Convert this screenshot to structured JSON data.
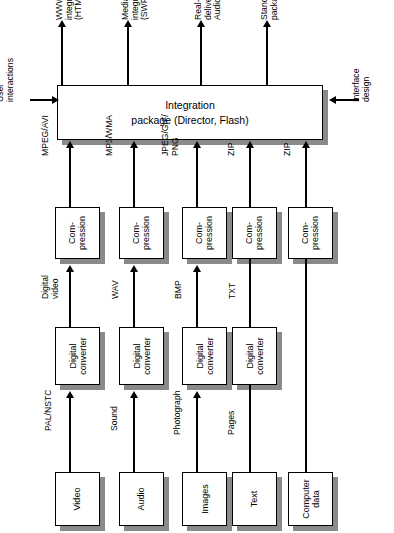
{
  "diagram": {
    "orientation": "rotated-90-ccw",
    "hub": {
      "label": "Integration\npackage (Director, Flash)",
      "left_input": "User\ninteractions",
      "right_input": "Interface\ndesign"
    },
    "outputs": [
      {
        "id": "www",
        "label": "WWW\nintegration\n(HTML/GIF)"
      },
      {
        "id": "mediaplayer",
        "label": "Media player\nintegration\n(SWF/DCR)"
      },
      {
        "id": "realtime",
        "label": "Real-time\ndelivery (Real\nAudio)"
      },
      {
        "id": "standalone",
        "label": "Stand-alone\npackage (EXE)"
      }
    ],
    "columns": [
      {
        "id": "video",
        "source": "Video",
        "source_to_converter": "PAL/NSTC",
        "converter": "Digital\nconverter",
        "converter_to_compression": "Digital\nvideo",
        "compression": "Com-\npression",
        "compression_to_hub": "MPEG/AVI"
      },
      {
        "id": "audio",
        "source": "Audio",
        "source_to_converter": "Sound",
        "converter": "Digital\nconverter",
        "converter_to_compression": "WAV",
        "compression": "Com-\npression",
        "compression_to_hub": "MP3/WMA"
      },
      {
        "id": "images",
        "source": "Images",
        "source_to_converter": "Photograph",
        "converter": "Digital\nconverter",
        "converter_to_compression": "BMP",
        "compression": "Com-\npression",
        "compression_to_hub": "JPEG/GIF/\nPNG"
      },
      {
        "id": "text",
        "source": "Text",
        "source_to_converter": "Pages",
        "converter": "Digital\nconverter",
        "converter_to_compression": "TXT",
        "compression": "Com-\npression",
        "compression_to_hub": "ZIP"
      },
      {
        "id": "computer-data",
        "source": "Computer\ndata",
        "source_to_converter": "",
        "converter": "",
        "converter_to_compression": "",
        "compression": "Com-\npression",
        "compression_to_hub": "ZIP"
      }
    ],
    "colors": {
      "line": "#000000",
      "box_fill": "#ffffff",
      "box_border": "#000000",
      "shadow": "#8a8a8a",
      "background": "#ffffff"
    }
  }
}
